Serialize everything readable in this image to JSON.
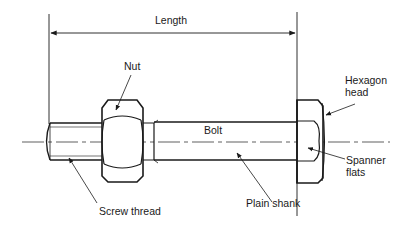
{
  "diagram": {
    "colors": {
      "line": "#1a1a1a",
      "background": "#ffffff"
    },
    "labels": {
      "length": "Length",
      "nut": "Nut",
      "hexagon_head_line1": "Hexagon",
      "hexagon_head_line2": "head",
      "bolt": "Bolt",
      "spanner_flats_line1": "Spanner",
      "spanner_flats_line2": "flats",
      "screw_thread": "Screw thread",
      "plain_shank": "Plain shank"
    }
  }
}
